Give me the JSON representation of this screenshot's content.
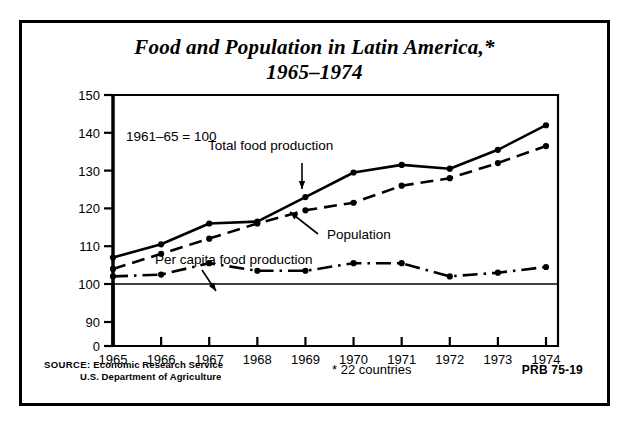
{
  "title": {
    "line1": "Food and Population in Latin America,*",
    "line2": "1965–1974"
  },
  "footer": {
    "source_label": "SOURCE:",
    "source_line1": "Economic Research Service",
    "source_line2": "U.S. Department of Agriculture",
    "footnote": "* 22 countries",
    "code": "PRB 75-19"
  },
  "chart_data": {
    "type": "line",
    "title": "Food and Population in Latin America,* 1965–1974",
    "subtitle": "",
    "base_note": "1961–65 = 100",
    "xlabel": "",
    "ylabel": "",
    "grid": false,
    "legend_position": "inline-annotations",
    "x": [
      1965,
      1966,
      1967,
      1968,
      1969,
      1970,
      1971,
      1972,
      1973,
      1974
    ],
    "xtick_labels": [
      "1965",
      "1966",
      "1967",
      "1968",
      "1969",
      "1970",
      "1971",
      "1972",
      "1973",
      "1974"
    ],
    "ytick_labels": [
      "0",
      "90",
      "100",
      "110",
      "120",
      "130",
      "140",
      "150"
    ],
    "ylim": [
      0,
      150
    ],
    "axis_break": true,
    "reference_line": 100,
    "series": [
      {
        "name": "Total food production",
        "style": "solid",
        "values": [
          107,
          110.5,
          116,
          116.5,
          123,
          129.5,
          131.5,
          130.5,
          135.5,
          142
        ]
      },
      {
        "name": "Population",
        "style": "dashed",
        "values": [
          104,
          108,
          112,
          116,
          119.5,
          121.5,
          126,
          128,
          132,
          136.5
        ]
      },
      {
        "name": "Per capita food production",
        "style": "dash-dot",
        "values": [
          102,
          102.5,
          105.5,
          103.5,
          103.5,
          105.5,
          105.5,
          102,
          103,
          104.5
        ]
      }
    ],
    "annotations": [
      {
        "text": "Total food production",
        "target_series": "Total food production"
      },
      {
        "text": "Population",
        "target_series": "Population"
      },
      {
        "text": "Per capita food production",
        "target_series": "Per capita food production"
      }
    ]
  }
}
